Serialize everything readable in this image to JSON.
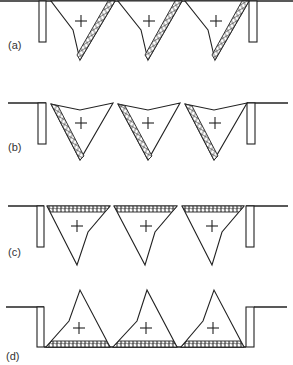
{
  "figure": {
    "panels": [
      {
        "id": "a",
        "label": "(a)",
        "hatched_face": "right edge",
        "orientation": "apex down"
      },
      {
        "id": "b",
        "label": "(b)",
        "hatched_face": "left edge",
        "orientation": "apex down"
      },
      {
        "id": "c",
        "label": "(c)",
        "hatched_face": "top edge",
        "orientation": "apex down"
      },
      {
        "id": "d",
        "label": "(d)",
        "hatched_face": "bottom edge",
        "orientation": "apex up"
      }
    ],
    "marker_symbol": "+",
    "triangles_per_panel": 3,
    "colors": {
      "stroke": "#222222",
      "background": "#ffffff"
    }
  }
}
